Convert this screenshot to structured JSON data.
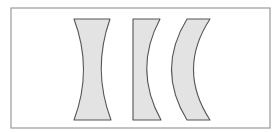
{
  "diagram": {
    "title": "",
    "colors": {
      "background": "#ffffff",
      "frame": "#9a9a9a",
      "lens_fill": "#e3e3e3",
      "lens_stroke": "#555555"
    },
    "frame": {
      "x": 11,
      "y": 8,
      "width": 259,
      "height": 120
    },
    "lenses": [
      {
        "name": "biconcave",
        "path": "M74,19 L110,19 Q92,69.5 111,120 L74,120 Q93,69.5 74,19 Z"
      },
      {
        "name": "plano-concave",
        "path": "M133,19 L160,19 Q133,69.5 161,120 L133,120 Z"
      },
      {
        "name": "concave-convex-meniscus",
        "path": "M187,19 L210,19 Q177,69.5 210,120 L187,120 Q156,69.5 187,19 Z"
      }
    ]
  }
}
